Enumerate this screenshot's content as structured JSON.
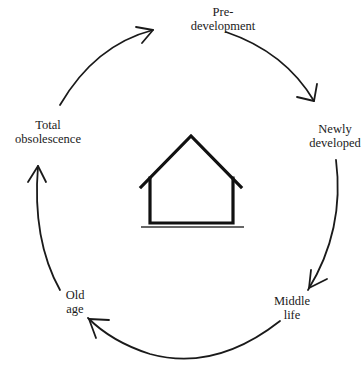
{
  "diagram": {
    "type": "cycle",
    "center_icon": "house-icon",
    "direction": "clockwise",
    "stages": [
      {
        "id": "pre-development",
        "lines": [
          "Pre-",
          "development"
        ]
      },
      {
        "id": "newly-developed",
        "lines": [
          "Newly",
          "developed"
        ]
      },
      {
        "id": "middle-life",
        "lines": [
          "Middle",
          "life"
        ]
      },
      {
        "id": "old-age",
        "lines": [
          "Old",
          "age"
        ]
      },
      {
        "id": "total-obsolescence",
        "lines": [
          "Total",
          "obsolescence"
        ]
      }
    ],
    "colors": {
      "stroke": "#1a1a1a",
      "background": "#ffffff"
    }
  }
}
